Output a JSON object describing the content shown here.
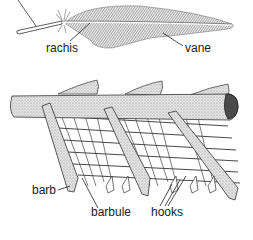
{
  "diagram": {
    "labels": {
      "rachis": "rachis",
      "vane": "vane",
      "barb": "barb",
      "barbule": "barbule",
      "hooks": "hooks"
    }
  }
}
